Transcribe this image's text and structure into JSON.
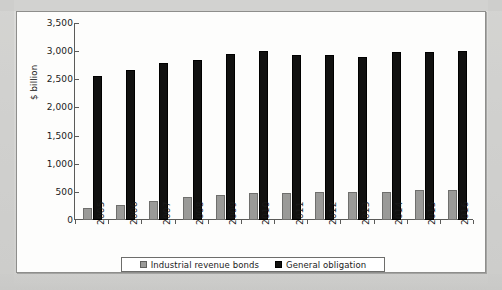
{
  "chart_data": {
    "type": "bar",
    "title": "",
    "xlabel": "",
    "ylabel": "$ billion",
    "ylim": [
      0,
      3500
    ],
    "ytick_step": 500,
    "yticks": [
      "0",
      "500",
      "1,000",
      "1,500",
      "2,000",
      "2,500",
      "3,000",
      "3,500"
    ],
    "grid": false,
    "legend_position": "bottom",
    "categories": [
      "2005",
      "2006",
      "2007",
      "2008",
      "2009",
      "2010",
      "2011",
      "2012",
      "2013",
      "2014",
      "2015",
      "2016"
    ],
    "series": [
      {
        "name": "Industrial revenue bonds",
        "color": "#9a9a98",
        "values": [
          215,
          275,
          345,
          405,
          450,
          480,
          480,
          490,
          490,
          500,
          530,
          540
        ]
      },
      {
        "name": "General obligation",
        "color": "#111110",
        "values": [
          2550,
          2670,
          2790,
          2840,
          2950,
          3010,
          2940,
          2940,
          2900,
          2990,
          2980,
          3010
        ]
      }
    ]
  },
  "legend": {
    "items": [
      {
        "label": "Industrial revenue bonds",
        "marker": "square-marker-gray"
      },
      {
        "label": "General obligation",
        "marker": "square-marker-black"
      }
    ]
  }
}
